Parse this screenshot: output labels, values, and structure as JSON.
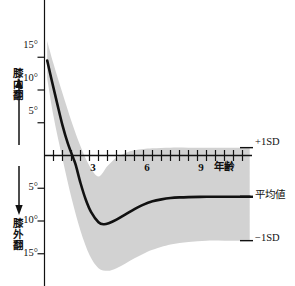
{
  "chart_data": {
    "type": "line",
    "title": "",
    "subtitle": "",
    "xlabel": "年齢",
    "ylabel_upper": "膝内翻",
    "ylabel_lower": "膝外翻",
    "xlim": [
      0,
      11.5
    ],
    "ylim_deg": [
      -17,
      17
    ],
    "y_sign_note": "positive = 膝内翻 (varus, above zero); negative = 膝外翻 (valgus, below zero)",
    "grid": false,
    "legend_position": "right-inline",
    "x_ticks": [
      0.5,
      1,
      1.5,
      2,
      2.5,
      3,
      3.5,
      4,
      4.5,
      5,
      5.5,
      6,
      6.5,
      7,
      7.5,
      8,
      8.5,
      9,
      9.5,
      10,
      10.5,
      11
    ],
    "x_tick_labels": [
      {
        "x": 3,
        "label": "3"
      },
      {
        "x": 6,
        "label": "6"
      },
      {
        "x": 9,
        "label": "9"
      }
    ],
    "y_ticks_deg": [
      15,
      10,
      5,
      -5,
      -10,
      -15
    ],
    "y_tick_labels": [
      {
        "y": 15,
        "label": "15°"
      },
      {
        "y": 10,
        "label": "10°"
      },
      {
        "y": 5,
        "label": "5°"
      },
      {
        "y": -5,
        "label": "5°"
      },
      {
        "y": -10,
        "label": "10°"
      },
      {
        "y": -15,
        "label": "15°"
      }
    ],
    "series": [
      {
        "name": "平均値",
        "kind": "line",
        "color": "#111111",
        "x": [
          0.15,
          0.4,
          0.7,
          1.0,
          1.3,
          1.6,
          1.75,
          2.0,
          2.3,
          2.6,
          3.0,
          3.3,
          3.6,
          4.0,
          4.5,
          5.0,
          5.5,
          6.0,
          6.5,
          7.0,
          7.5,
          8.0,
          9.0,
          10.0,
          11.0,
          11.4
        ],
        "y": [
          14.5,
          11.5,
          8.0,
          4.6,
          1.8,
          -0.4,
          -1.6,
          -4.2,
          -6.8,
          -8.7,
          -10.2,
          -10.5,
          -10.3,
          -9.8,
          -9.0,
          -8.2,
          -7.5,
          -7.0,
          -6.7,
          -6.5,
          -6.4,
          -6.35,
          -6.3,
          -6.3,
          -6.3,
          -6.3
        ]
      },
      {
        "name": "+1SD",
        "kind": "band-upper",
        "color": "#d2d2d2",
        "x": [
          0.15,
          0.5,
          1.0,
          1.5,
          2.0,
          2.5,
          3.0,
          3.5,
          4.0,
          4.5,
          5.0,
          5.5,
          6.0,
          7.0,
          8.0,
          9.0,
          10.0,
          11.0,
          11.4
        ],
        "y": [
          17.5,
          14.0,
          9.5,
          5.2,
          1.4,
          -1.6,
          -3.2,
          -1.6,
          -0.3,
          0.4,
          0.8,
          1.0,
          1.1,
          1.2,
          1.2,
          1.2,
          1.2,
          1.2,
          1.2
        ]
      },
      {
        "name": "-1SD",
        "kind": "band-lower",
        "color": "#d2d2d2",
        "x": [
          0.15,
          0.5,
          1.0,
          1.5,
          2.0,
          2.5,
          3.0,
          3.5,
          4.0,
          4.5,
          5.0,
          5.5,
          6.0,
          7.0,
          8.0,
          9.0,
          10.0,
          11.0,
          11.4
        ],
        "y": [
          11.8,
          6.0,
          -0.5,
          -6.5,
          -11.5,
          -15.2,
          -17.2,
          -17.6,
          -17.2,
          -16.5,
          -15.7,
          -15.0,
          -14.4,
          -13.6,
          -13.2,
          -13.0,
          -13.0,
          -13.0,
          -13.0
        ]
      }
    ],
    "annotations": [
      {
        "name": "plus-1sd",
        "text": "+1SD",
        "at_x": 11.4,
        "at_y": 1.2
      },
      {
        "name": "mean",
        "text": "平均値",
        "at_x": 11.4,
        "at_y": -6.3
      },
      {
        "name": "minus-1sd",
        "text": "−1SD",
        "at_x": 11.4,
        "at_y": -13.0
      }
    ],
    "colors": {
      "band_fill": "#d2d2d2",
      "line": "#111111",
      "axis": "#111111",
      "text": "#111111",
      "background": "#ffffff"
    }
  },
  "labels": {
    "y_upper_direction": "膝内翻",
    "y_lower_direction": "膝外翻",
    "x_axis_name": "年齢",
    "right_plus_sd": "+1SD",
    "right_mean": "平均値",
    "right_minus_sd": "−1SD",
    "ytick_15_upper": "15°",
    "ytick_10_upper": "10°",
    "ytick_5_upper": "5°",
    "ytick_5_lower": "5°",
    "ytick_10_lower": "10°",
    "ytick_15_lower": "15°",
    "xtick_3": "3",
    "xtick_6": "6",
    "xtick_9": "9"
  }
}
